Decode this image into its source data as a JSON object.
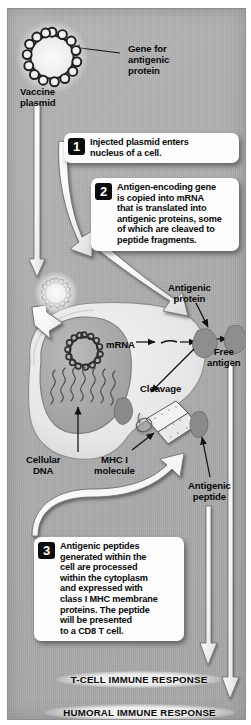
{
  "diagram": {
    "background_color": "#b0b0b0",
    "panel_border_color": "#ffffff"
  },
  "steps": [
    {
      "number": "1",
      "text": "Injected plasmid enters\nnucleus of a cell."
    },
    {
      "number": "2",
      "text": "Antigen-encoding gene\nis copied into mRNA\nthat is translated into\nantigenic proteins, some\nof which are cleaved to\npeptide fragments."
    },
    {
      "number": "3",
      "text": "Antigenic peptides\ngenerated within the\ncell are processed\nwithin the cytoplasm\nand expressed with\nclass I MHC membrane\nproteins. The peptide\nwill be presented\nto a CD8 T cell."
    }
  ],
  "labels": {
    "vaccine_plasmid": "Vaccine\nplasmid",
    "gene_for_antigenic_protein": "Gene for\nantigenic\nprotein",
    "antigenic_protein": "Antigenic\nprotein",
    "mrna": "mRNA",
    "cleavage": "Cleavage",
    "free_antigen": "Free\nantigen",
    "cellular_dna": "Cellular\nDNA",
    "mhc_i_molecule": "MHC I\nmolecule",
    "antigenic_peptide": "Antigenic\npeptide"
  },
  "outcomes": {
    "t_cell": "T-CELL IMMUNE RESPONSE",
    "humoral": "HUMORAL IMMUNE RESPONSE"
  },
  "structures": {
    "nucleus": "nucleus",
    "cytoplasm": "cytoplasm",
    "cell_membrane": "cell-membrane",
    "plasmid_ring": "plasmid-ring",
    "dna_strands": "cellular-dna-strands",
    "protein_blob": "antigenic-protein-blob",
    "free_antigen_blob": "free-antigen-blob",
    "peptide_blob": "peptide-fragment-blob",
    "mhc_molecule": "mhc-i-molecule"
  }
}
